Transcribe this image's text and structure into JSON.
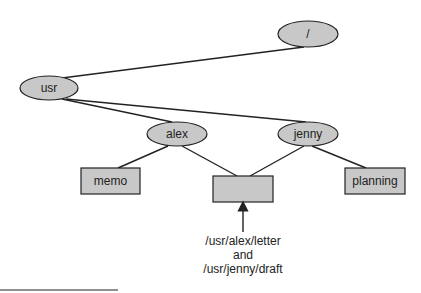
{
  "diagram": {
    "type": "directory-tree-hard-link",
    "colors": {
      "node_fill": "#c8c8c8",
      "stroke": "#222222",
      "background": "#ffffff"
    },
    "nodes": [
      {
        "id": "root",
        "label": "/",
        "shape": "ellipse"
      },
      {
        "id": "usr",
        "label": "usr",
        "shape": "ellipse"
      },
      {
        "id": "alex",
        "label": "alex",
        "shape": "ellipse"
      },
      {
        "id": "jenny",
        "label": "jenny",
        "shape": "ellipse"
      },
      {
        "id": "memo",
        "label": "memo",
        "shape": "rect"
      },
      {
        "id": "shared",
        "label": "",
        "shape": "rect"
      },
      {
        "id": "planning",
        "label": "planning",
        "shape": "rect"
      }
    ],
    "edges": [
      [
        "root",
        "usr"
      ],
      [
        "usr",
        "alex"
      ],
      [
        "usr",
        "jenny"
      ],
      [
        "alex",
        "memo"
      ],
      [
        "alex",
        "shared"
      ],
      [
        "jenny",
        "shared"
      ],
      [
        "jenny",
        "planning"
      ]
    ],
    "annotation": {
      "line1": "/usr/alex/letter",
      "line2": "and",
      "line3": "/usr/jenny/draft",
      "points_to": "shared"
    }
  }
}
